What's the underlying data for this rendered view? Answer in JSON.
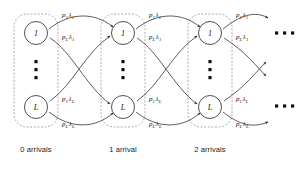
{
  "diagram": {
    "colors": {
      "stroke": "#333333",
      "box_stroke": "#8a8a8a",
      "text": "#111111",
      "background": "#ffffff"
    },
    "stages": [
      {
        "caption": "0 arrivals",
        "nodes": [
          {
            "label": "1"
          },
          {
            "label": "L"
          }
        ]
      },
      {
        "caption": "1 arrival",
        "nodes": [
          {
            "label": "1"
          },
          {
            "label": "L"
          }
        ]
      },
      {
        "caption": "2 arrivals",
        "nodes": [
          {
            "label": "1"
          },
          {
            "label": "L"
          }
        ]
      }
    ],
    "node_labels": {
      "top": "1",
      "bottom": "L"
    },
    "rate_labels": [
      {
        "id": "s0-top-upper",
        "p": "p",
        "p_sub": "1",
        "lam": "λ",
        "lam_sub": "1",
        "x": 62,
        "y": 17
      },
      {
        "id": "s0-top-lower",
        "p": "p",
        "p_sub": "L",
        "lam": "λ",
        "lam_sub": "1",
        "x": 62,
        "y": 39
      },
      {
        "id": "s0-bot-upper",
        "p": "p",
        "p_sub": "1",
        "lam": "λ",
        "lam_sub": "L",
        "x": 62,
        "y": 101
      },
      {
        "id": "s0-bot-lower",
        "p": "p",
        "p_sub": "L",
        "lam": "λ",
        "lam_sub": "L",
        "x": 62,
        "y": 126
      },
      {
        "id": "s1-top-upper",
        "p": "p",
        "p_sub": "1",
        "lam": "λ",
        "lam_sub": "1",
        "x": 149,
        "y": 17
      },
      {
        "id": "s1-top-lower",
        "p": "p",
        "p_sub": "L",
        "lam": "λ",
        "lam_sub": "1",
        "x": 149,
        "y": 39
      },
      {
        "id": "s1-bot-upper",
        "p": "p",
        "p_sub": "1",
        "lam": "λ",
        "lam_sub": "L",
        "x": 149,
        "y": 101
      },
      {
        "id": "s1-bot-lower",
        "p": "p",
        "p_sub": "L",
        "lam": "λ",
        "lam_sub": "L",
        "x": 149,
        "y": 126
      },
      {
        "id": "s2-top-upper",
        "p": "p",
        "p_sub": "1",
        "lam": "λ",
        "lam_sub": "1",
        "x": 236,
        "y": 17
      },
      {
        "id": "s2-top-lower",
        "p": "p",
        "p_sub": "L",
        "lam": "λ",
        "lam_sub": "1",
        "x": 236,
        "y": 39
      },
      {
        "id": "s2-bot-upper",
        "p": "p",
        "p_sub": "1",
        "lam": "λ",
        "lam_sub": "L",
        "x": 236,
        "y": 101
      },
      {
        "id": "s2-bot-lower",
        "p": "p",
        "p_sub": "L",
        "lam": "λ",
        "lam_sub": "L",
        "x": 236,
        "y": 126
      }
    ],
    "continuation": {
      "symbol": "···",
      "positions": [
        {
          "x": 285,
          "y": 33
        },
        {
          "x": 285,
          "y": 106
        }
      ]
    },
    "vertical_ellipsis_symbol": "⋮"
  }
}
